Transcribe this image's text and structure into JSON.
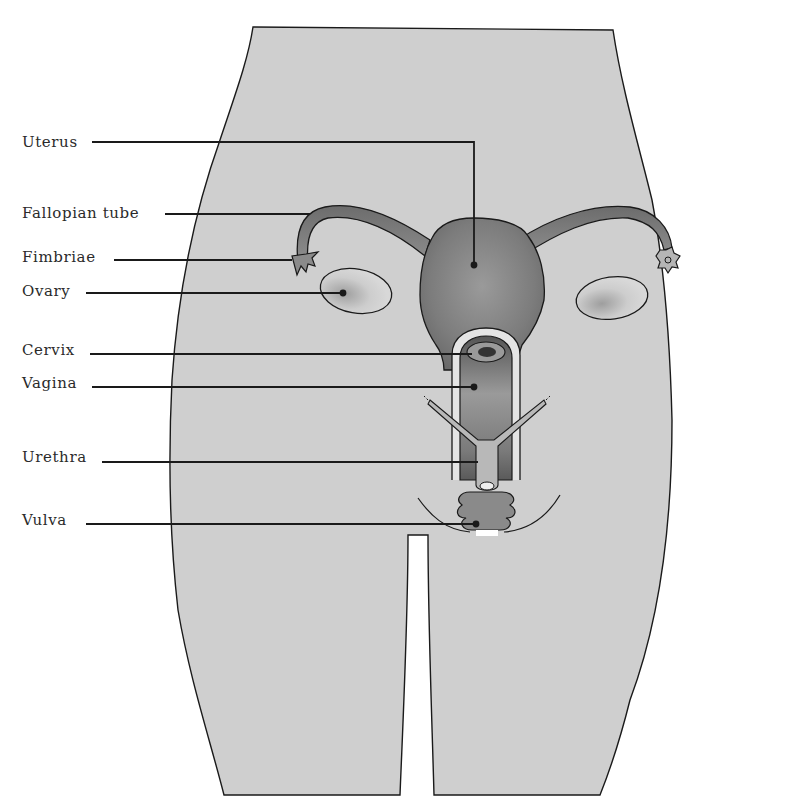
{
  "diagram": {
    "colors": {
      "background": "#ffffff",
      "body_fill": "#cfcfcf",
      "outline": "#1a1a1a",
      "organ_fill": "#8a8a8a",
      "organ_dark": "#5a5a5a",
      "leader_line": "#1a1a1a",
      "label_text": "#2a2a2a"
    },
    "labels": [
      {
        "id": "uterus",
        "text": "Uterus",
        "x": 22,
        "y": 133
      },
      {
        "id": "fallopian-tube",
        "text": "Fallopian tube",
        "x": 22,
        "y": 204
      },
      {
        "id": "fimbriae",
        "text": "Fimbriae",
        "x": 22,
        "y": 248
      },
      {
        "id": "ovary",
        "text": "Ovary",
        "x": 22,
        "y": 282
      },
      {
        "id": "cervix",
        "text": "Cervix",
        "x": 22,
        "y": 341
      },
      {
        "id": "vagina",
        "text": "Vagina",
        "x": 22,
        "y": 374
      },
      {
        "id": "urethra",
        "text": "Urethra",
        "x": 22,
        "y": 448
      },
      {
        "id": "vulva",
        "text": "Vulva",
        "x": 22,
        "y": 511
      }
    ]
  }
}
